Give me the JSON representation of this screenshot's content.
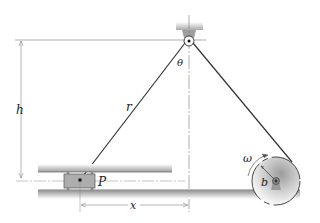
{
  "diagram": {
    "type": "mechanics-figure",
    "labels": {
      "h": "h",
      "r": "r",
      "theta": "θ",
      "P": "P",
      "x": "x",
      "omega": "ω",
      "b": "b"
    },
    "colors": {
      "rope": "#333333",
      "dimension_line": "#777777",
      "rail_shade": "#bdbdbd",
      "ground": "#9a9a9a",
      "collar": "#a9a9a9",
      "disk_shade": "#c8c8c8"
    }
  }
}
